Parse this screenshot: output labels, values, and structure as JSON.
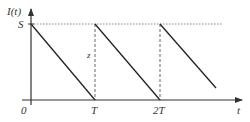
{
  "diagram": {
    "type": "sawtooth-inventory-plot",
    "y_axis_label": "I(t)",
    "x_axis_label": "t",
    "level_label": "S",
    "origin_label": "0",
    "x_ticks": [
      "T",
      "2T"
    ],
    "segment_label": "z",
    "colors": {
      "axis": "#333333",
      "line": "#222222",
      "dotted": "#888888",
      "dashed": "#666666",
      "text": "#333333"
    }
  }
}
